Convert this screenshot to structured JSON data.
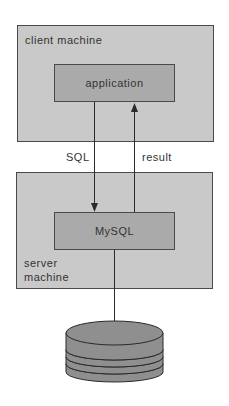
{
  "diagram": {
    "client_box": {
      "label": "client machine"
    },
    "application_box": {
      "label": "application"
    },
    "server_box": {
      "label_line1": "server",
      "label_line2": "machine"
    },
    "mysql_box": {
      "label": "MySQL"
    },
    "arrows": {
      "request_label": "SQL",
      "response_label": "result"
    },
    "database": {
      "icon": "database-disk-stack-icon",
      "platters": 4
    },
    "colors": {
      "outer_fill": "#c9c9c9",
      "inner_fill": "#aaaaaa",
      "disk_fill": "#8f8f8f",
      "stroke": "#3a3a3a"
    }
  }
}
